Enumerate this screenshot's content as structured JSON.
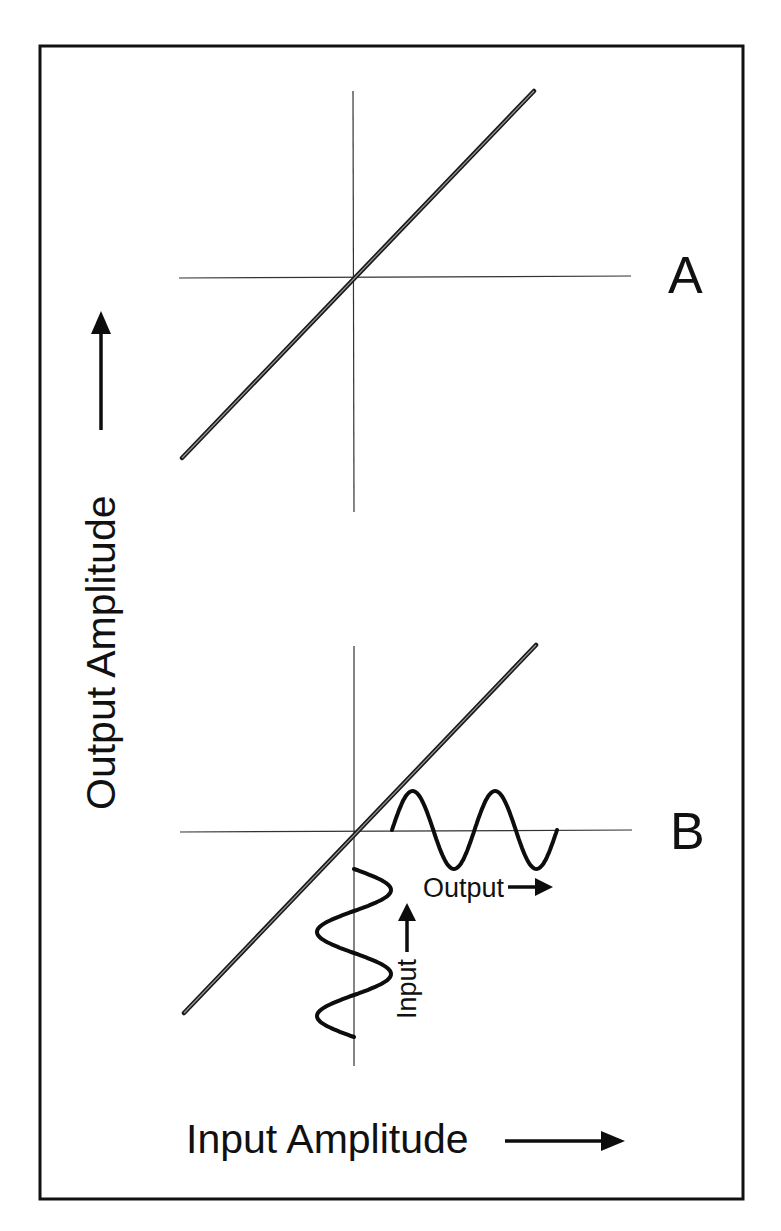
{
  "figure": {
    "panels": [
      {
        "label": "A",
        "description": "Linear transfer function through origin",
        "transfer_line": {
          "from": [
            -1,
            -1
          ],
          "to": [
            1,
            1
          ]
        },
        "waveforms": []
      },
      {
        "label": "B",
        "description": "Linear transfer function with sinusoidal input mapped to sinusoidal output",
        "transfer_line": {
          "from": [
            -1,
            -1
          ],
          "to": [
            1,
            1
          ]
        },
        "waveforms": [
          {
            "name": "input",
            "label": "Input",
            "orientation": "vertical",
            "cycles": 2,
            "arrow_direction": "up"
          },
          {
            "name": "output",
            "label": "Output",
            "orientation": "horizontal",
            "cycles": 2,
            "arrow_direction": "right"
          }
        ]
      }
    ],
    "x_axis_title": "Input Amplitude",
    "y_axis_title": "Output Amplitude",
    "colors": {
      "ink": "#111111",
      "axis": "#333333",
      "background": "#ffffff"
    }
  }
}
